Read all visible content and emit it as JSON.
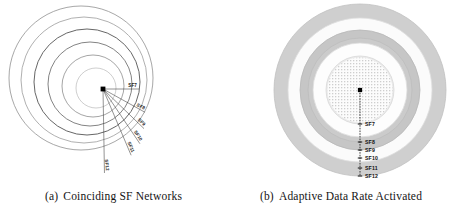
{
  "figure": {
    "panels": [
      {
        "id": "coinciding-sf-networks",
        "caption_tag": "(a)",
        "caption_text": "Coinciding SF Networks",
        "node_label": "gateway-node",
        "type": "eccentric-circles-with-radials",
        "geometry": {
          "node": {
            "x": 103,
            "y": 89
          },
          "circle_count": 6,
          "circles": [
            {
              "cx": 96,
              "cy": 88,
              "r": 20,
              "stroke": "#b9b9b9",
              "stroke_width": 0.7
            },
            {
              "cx": 93,
              "cy": 86,
              "r": 31,
              "stroke": "#8e8e8e",
              "stroke_width": 0.8
            },
            {
              "cx": 90,
              "cy": 84,
              "r": 42,
              "stroke": "#6d6d6d",
              "stroke_width": 0.85
            },
            {
              "cx": 87,
              "cy": 82,
              "r": 53,
              "stroke": "#555555",
              "stroke_width": 0.9
            },
            {
              "cx": 84,
              "cy": 80,
              "r": 63,
              "stroke": "#9c9c9c",
              "stroke_width": 0.8
            },
            {
              "cx": 81,
              "cy": 78,
              "r": 72,
              "stroke": "#909090",
              "stroke_width": 0.8
            }
          ]
        },
        "radials": [
          {
            "label": "SF7",
            "angle_deg": 0,
            "length": 36,
            "label_rot": 0
          },
          {
            "label": "SF8",
            "angle_deg": 29,
            "length": 48,
            "label_rot": 29
          },
          {
            "label": "SF9",
            "angle_deg": 44,
            "length": 57,
            "label_rot": 44
          },
          {
            "label": "SF10",
            "angle_deg": 56,
            "length": 66,
            "label_rot": 56
          },
          {
            "label": "SF11",
            "angle_deg": 67,
            "length": 72,
            "label_rot": 67
          },
          {
            "label": "SF12",
            "angle_deg": 89,
            "length": 84,
            "label_rot": 84
          }
        ]
      },
      {
        "id": "adaptive-data-rate-activated",
        "caption_tag": "(b)",
        "caption_text": "Adaptive Data Rate Activated",
        "node_label": "gateway-node",
        "type": "concentric-annuli-with-axis",
        "geometry": {
          "center": {
            "x": 133,
            "y": 90
          },
          "node": {
            "x": 133,
            "y": 90
          },
          "rings": [
            {
              "label": "SF7",
              "r_inner": 0,
              "r_outer": 34,
              "fill": "#ebebeb",
              "stroke": "#d8d8d8"
            },
            {
              "label": "SF8",
              "r_inner": 34,
              "r_outer": 47,
              "fill": "#fdfdfd",
              "stroke": "#dddddd"
            },
            {
              "label": "SF9",
              "r_inner": 47,
              "r_outer": 52,
              "fill": "#cbcbcb",
              "stroke": "#bdbdbd"
            },
            {
              "label": "SF10",
              "r_inner": 52,
              "r_outer": 60,
              "fill": "#c6c6c6",
              "stroke": "#b8b8b8"
            },
            {
              "label": "SF11",
              "r_inner": 60,
              "r_outer": 72,
              "fill": "#fbfbfb",
              "stroke": "#e0e0e0"
            },
            {
              "label": "SF12",
              "r_inner": 72,
              "r_outer": 86,
              "fill": "#cfcfcf",
              "stroke": "#c0c0c0"
            }
          ],
          "axis": {
            "x": 133,
            "y_top": 90,
            "y_bottom": 176,
            "tick_labels": [
              "SF7",
              "SF8",
              "SF9",
              "SF10",
              "SF11",
              "SF12"
            ],
            "tick_y": [
              124,
              142,
              150,
              158,
              168,
              176
            ],
            "label_offset_x": 5
          }
        }
      }
    ]
  },
  "chart_data": {
    "type": "diagram",
    "series": [
      {
        "name": "Coinciding SF Networks",
        "categories": [
          "SF7",
          "SF8",
          "SF9",
          "SF10",
          "SF11",
          "SF12"
        ],
        "values": [
          36,
          48,
          57,
          66,
          72,
          84
        ],
        "note": "Radial reach (px) per spreading factor; all SF regions overlap from the gateway."
      },
      {
        "name": "Adaptive Data Rate Activated",
        "categories": [
          "SF7",
          "SF8",
          "SF9",
          "SF10",
          "SF11",
          "SF12"
        ],
        "values": [
          34,
          47,
          52,
          60,
          72,
          86
        ],
        "note": "Outer radius (px) of each concentric SF annulus."
      }
    ],
    "legend_position": "none",
    "grid": false
  },
  "colors": {
    "stroke_dark": "#444444",
    "stroke_light": "#b9b9b9",
    "node": "#000000",
    "text": "#141414"
  }
}
